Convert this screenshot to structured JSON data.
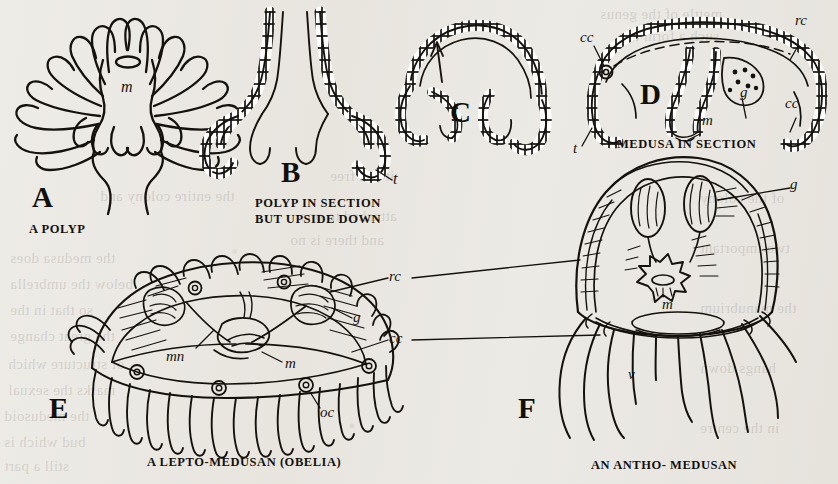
{
  "plate": {
    "title": "Polyp and Medusa comparative plate",
    "background_color": "#e9e7e2",
    "ink_color": "#15120e",
    "figures": [
      {
        "letter": "A",
        "caption": "A POLYP",
        "labels": [
          {
            "key": "m",
            "meaning": "mouth"
          }
        ]
      },
      {
        "letter": "B",
        "caption_line1": "POLYP IN SECTION",
        "caption_line2": "BUT UPSIDE DOWN",
        "labels": [
          {
            "key": "t",
            "meaning": "tentacle"
          }
        ]
      },
      {
        "letter": "C",
        "caption": "",
        "labels": []
      },
      {
        "letter": "D",
        "caption": "MEDUSA IN SECTION",
        "labels": [
          {
            "key": "cc",
            "meaning": "circular canal"
          },
          {
            "key": "rc",
            "meaning": "radial canal"
          },
          {
            "key": "g",
            "meaning": "gonad"
          },
          {
            "key": "m",
            "meaning": "mouth"
          },
          {
            "key": "t",
            "meaning": "tentacle"
          },
          {
            "key": "cc2",
            "meaning": "circular canal"
          }
        ]
      },
      {
        "letter": "E",
        "caption": "A LEPTO-MEDUSAN (OBELIA)",
        "labels": [
          {
            "key": "mn",
            "meaning": "manubrium"
          },
          {
            "key": "m",
            "meaning": "mouth"
          },
          {
            "key": "g",
            "meaning": "gonad"
          },
          {
            "key": "oc",
            "meaning": "ocellus"
          }
        ]
      },
      {
        "letter": "F",
        "caption": "AN ANTHO- MEDUSAN",
        "labels": [
          {
            "key": "g",
            "meaning": "gonad"
          },
          {
            "key": "rc",
            "meaning": "radial canal"
          },
          {
            "key": "cc",
            "meaning": "circular canal"
          },
          {
            "key": "m",
            "meaning": "mouth"
          },
          {
            "key": "v",
            "meaning": "velum"
          }
        ]
      }
    ],
    "shared_labels": {
      "rc": "rc",
      "cc": "cc"
    },
    "label_text": {
      "m": "m",
      "t": "t",
      "cc": "cc",
      "rc": "rc",
      "g": "g",
      "mn": "mn",
      "oc": "oc",
      "v": "v"
    },
    "bleed_text": {
      "l1": "mettle of the genus",
      "l2": "such a form the",
      "l3": "the entire colony and",
      "l4": "it is a free",
      "l5": "attached to one",
      "l6": "and there is no",
      "l7": "the medusa does",
      "l8": "below the umbrella",
      "l9": "so that in the",
      "l10": "the great change",
      "l11": "of structure which",
      "l12": "marks the sexual",
      "l13": "the medusoid",
      "l14": "bud which is",
      "l15": "still a part",
      "l16": "of the colony",
      "l17": "two important",
      "l18": "the manubrium",
      "l19": "hangs down",
      "l20": "in the centre"
    }
  }
}
